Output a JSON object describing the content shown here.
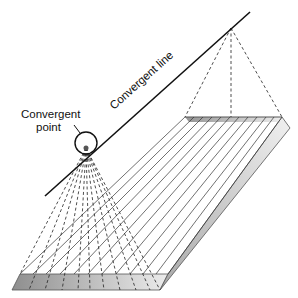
{
  "diagram": {
    "labels": {
      "convergent_point_line1": "Convergent",
      "convergent_point_line2": "point",
      "convergent_line": "Convergent line"
    },
    "colors": {
      "line": "#111111",
      "plate_stroke": "#444444",
      "front_face_dark": "#8e8e8e",
      "front_face_light": "#e6e6e6",
      "side_face": "#c8c8c8"
    }
  }
}
